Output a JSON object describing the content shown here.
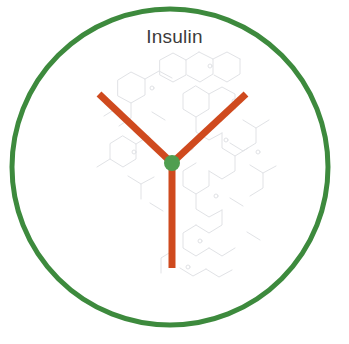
{
  "figure": {
    "title": "Insulin",
    "title_color": "#3b3b3b",
    "background_color": "#ffffff",
    "boundary_circle": {
      "name": "green-boundary-circle",
      "center_x": 170,
      "center_y": 167,
      "radius": 158,
      "stroke_color": "#3d8a3d",
      "stroke_width": 5,
      "fill": "none"
    },
    "antibody": {
      "name": "antibody-y-symbol",
      "hub": {
        "center_x": 172,
        "center_y": 163,
        "radius": 8,
        "color": "#4f9e4f"
      },
      "arm_color": "#cf4a1e",
      "arm_width": 7,
      "arms": [
        {
          "label": "upper-left-arm",
          "x1": 172,
          "y1": 163,
          "x2": 99,
          "y2": 94
        },
        {
          "label": "upper-right-arm",
          "x1": 172,
          "y1": 163,
          "x2": 246,
          "y2": 94
        },
        {
          "label": "lower-stem-arm",
          "x1": 172,
          "y1": 163,
          "x2": 172,
          "y2": 268
        }
      ]
    },
    "watermark": {
      "name": "molecular-structure-watermark",
      "color": "#c9ccd2",
      "description": "faint grey chemical structure drawing"
    }
  }
}
